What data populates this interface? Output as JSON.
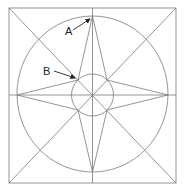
{
  "diagram": {
    "labels": [
      {
        "text": "A",
        "x": 65,
        "y": 35,
        "arrow_from": [
          73,
          30
        ],
        "arrow_to": [
          91,
          18
        ]
      },
      {
        "text": "B",
        "x": 43,
        "y": 75,
        "arrow_from": [
          53,
          71
        ],
        "arrow_to": [
          74,
          78
        ]
      }
    ],
    "colors": {
      "line": "#7a7a7a",
      "text": "#222222",
      "background": "#ffffff"
    }
  }
}
